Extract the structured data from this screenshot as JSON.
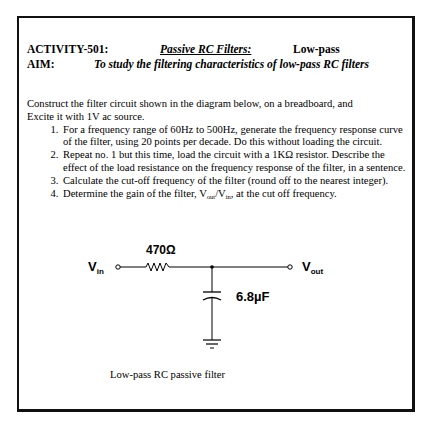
{
  "header": {
    "activity_label": "ACTIVITY-501:",
    "topic": "Passive RC Filters:",
    "type": "Low-pass",
    "aim_label": "AIM:",
    "aim_text": "To study the filtering characteristics of low-pass RC filters"
  },
  "intro": "Construct the filter circuit shown in the diagram below, on a breadboard, and Excite it with 1V ac source.",
  "steps": [
    "For a frequency range of 60Hz to 500Hz, generate the frequency response curve of the filter, using 20 points per decade. Do this without loading the circuit.",
    "Repeat no. 1 but this time, load the circuit with a 1KΩ resistor. Describe the effect of the load resistance on the frequency response of the filter, in a sentence.",
    "Calculate the cut-off frequency of the filter (round off to the nearest integer)."
  ],
  "step4": {
    "prefix": "Determine the gain of the filter, V",
    "sub_out": "out",
    "slash": "/V",
    "sub_in": "in",
    "suffix": ", at the cut off frequency."
  },
  "circuit": {
    "vin_label": "V",
    "vin_sub": "in",
    "vout_label": "V",
    "vout_sub": "out",
    "resistor_value": "470Ω",
    "capacitor_value": "6.8µF"
  },
  "caption": "Low-pass RC passive filter"
}
